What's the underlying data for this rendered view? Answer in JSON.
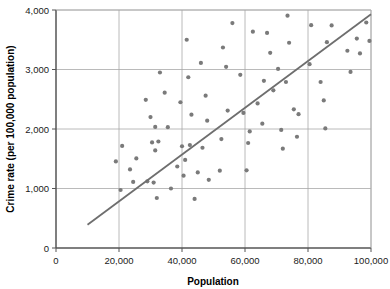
{
  "chart_data": {
    "type": "scatter",
    "title": "",
    "xlabel": "Population",
    "ylabel": "Crime rate (per 100,000 population)",
    "xlim": [
      0,
      100000
    ],
    "ylim": [
      0,
      4000
    ],
    "xticks": [
      0,
      20000,
      40000,
      60000,
      80000,
      100000
    ],
    "yticks": [
      0,
      1000,
      2000,
      3000,
      4000
    ],
    "xtick_labels": [
      "0",
      "20,000",
      "40,000",
      "60,000",
      "80,000",
      "100,000"
    ],
    "ytick_labels": [
      "0",
      "1,000",
      "2,000",
      "3,000",
      "4,000"
    ],
    "grid": true,
    "grid_axis": "both",
    "legend": "none",
    "series": [
      {
        "name": "Cities",
        "marker": "circle",
        "color": "#7a7a7a",
        "points": [
          [
            19000,
            1455
          ],
          [
            20500,
            975
          ],
          [
            21000,
            1715
          ],
          [
            23500,
            1320
          ],
          [
            24500,
            1110
          ],
          [
            25500,
            1505
          ],
          [
            28500,
            2490
          ],
          [
            29000,
            1120
          ],
          [
            30000,
            2200
          ],
          [
            30500,
            1775
          ],
          [
            31000,
            1100
          ],
          [
            31500,
            2035
          ],
          [
            31500,
            1640
          ],
          [
            32000,
            840
          ],
          [
            32500,
            1790
          ],
          [
            33000,
            2950
          ],
          [
            34500,
            2610
          ],
          [
            35500,
            2030
          ],
          [
            36500,
            1000
          ],
          [
            38500,
            1370
          ],
          [
            39500,
            2450
          ],
          [
            40000,
            1710
          ],
          [
            40500,
            1215
          ],
          [
            41000,
            1480
          ],
          [
            41500,
            3500
          ],
          [
            42000,
            2870
          ],
          [
            42500,
            1730
          ],
          [
            43000,
            2240
          ],
          [
            44000,
            825
          ],
          [
            45000,
            1270
          ],
          [
            46000,
            3110
          ],
          [
            46500,
            1685
          ],
          [
            47500,
            2560
          ],
          [
            48000,
            2140
          ],
          [
            48500,
            1145
          ],
          [
            52000,
            1300
          ],
          [
            52500,
            1830
          ],
          [
            53000,
            3370
          ],
          [
            54000,
            3045
          ],
          [
            54500,
            2310
          ],
          [
            56000,
            3780
          ],
          [
            58500,
            2910
          ],
          [
            59500,
            2270
          ],
          [
            60500,
            1305
          ],
          [
            61000,
            1765
          ],
          [
            61500,
            1960
          ],
          [
            62500,
            3635
          ],
          [
            64000,
            2430
          ],
          [
            65500,
            2090
          ],
          [
            66000,
            2810
          ],
          [
            67000,
            3615
          ],
          [
            68000,
            3280
          ],
          [
            69000,
            2650
          ],
          [
            70500,
            3010
          ],
          [
            71500,
            1985
          ],
          [
            72000,
            1670
          ],
          [
            73000,
            2790
          ],
          [
            73500,
            3905
          ],
          [
            74000,
            3450
          ],
          [
            75500,
            2330
          ],
          [
            76500,
            1870
          ],
          [
            77000,
            2250
          ],
          [
            80500,
            3090
          ],
          [
            81000,
            3745
          ],
          [
            84000,
            2790
          ],
          [
            85000,
            2480
          ],
          [
            85500,
            2010
          ],
          [
            86000,
            3460
          ],
          [
            87500,
            3740
          ],
          [
            92500,
            3315
          ],
          [
            93500,
            2960
          ],
          [
            95500,
            3520
          ],
          [
            96500,
            3270
          ],
          [
            98500,
            3790
          ],
          [
            99500,
            3480
          ]
        ]
      }
    ],
    "trendline": {
      "name": "Linear fit",
      "color": "#6e6e6e",
      "x_start": 10000,
      "y_start": 390,
      "x_end": 100000,
      "y_end": 3930
    }
  }
}
